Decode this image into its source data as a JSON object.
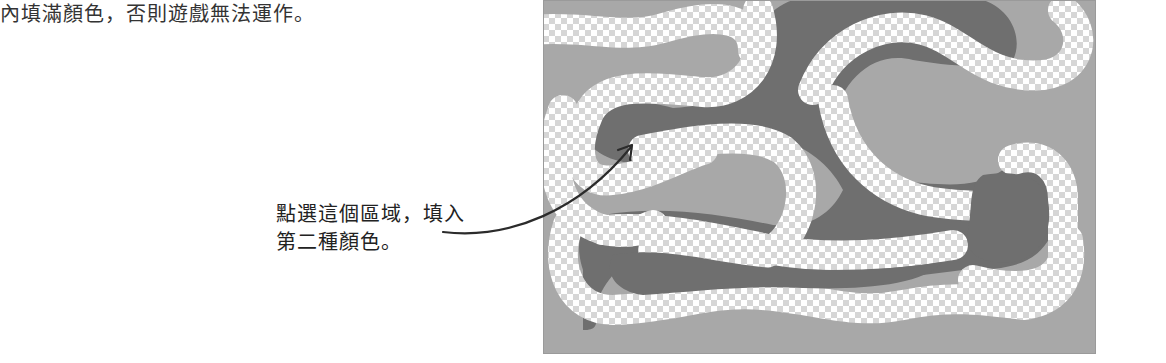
{
  "document": {
    "top_text": "內填滿顏色，否則遊戲無法運作。",
    "callout": {
      "line1": "點選這個區域，填入",
      "line2": "第二種顏色。"
    }
  },
  "figure": {
    "colors": {
      "background_region": "#a8a8a8",
      "second_color_region": "#6f6f6f",
      "checker_light": "#ffffff",
      "checker_dark": "#d6d6d6",
      "arrow": "#2b2b2b"
    }
  }
}
